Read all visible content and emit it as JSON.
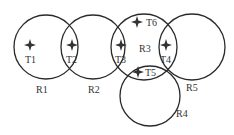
{
  "diagram": {
    "regions": [
      {
        "id": "R1",
        "label": "R1",
        "cx": 46,
        "cy": 47,
        "r": 32,
        "label_x": 36,
        "label_y": 93
      },
      {
        "id": "R2",
        "label": "R2",
        "cx": 93,
        "cy": 47,
        "r": 32,
        "label_x": 88,
        "label_y": 93
      },
      {
        "id": "R3",
        "label": "R3",
        "cx": 144,
        "cy": 47,
        "r": 33,
        "label_x": 139,
        "label_y": 52
      },
      {
        "id": "R4",
        "label": "R4",
        "cx": 150,
        "cy": 96,
        "r": 30,
        "label_x": 176,
        "label_y": 117
      },
      {
        "id": "R5",
        "label": "R5",
        "cx": 192,
        "cy": 47,
        "r": 33,
        "label_x": 186,
        "label_y": 91
      }
    ],
    "targets": [
      {
        "id": "T1",
        "label": "T1",
        "x": 30,
        "y": 45,
        "label_x": 25,
        "label_y": 63
      },
      {
        "id": "T2",
        "label": "T2",
        "x": 72,
        "y": 45,
        "label_x": 66,
        "label_y": 63
      },
      {
        "id": "T3",
        "label": "T3",
        "x": 121,
        "y": 45,
        "label_x": 115,
        "label_y": 63
      },
      {
        "id": "T4",
        "label": "T4",
        "x": 166,
        "y": 45,
        "label_x": 160,
        "label_y": 63
      },
      {
        "id": "T5",
        "label": "T5",
        "x": 138,
        "y": 72,
        "label_x": 145,
        "label_y": 76
      },
      {
        "id": "T6",
        "label": "T6",
        "x": 137,
        "y": 22,
        "label_x": 146,
        "label_y": 26
      }
    ],
    "colors": {
      "stroke": "#2a2a2a",
      "text": "#333333",
      "background": "#ffffff"
    }
  }
}
